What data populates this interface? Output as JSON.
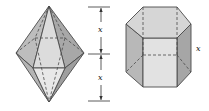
{
  "figure": {
    "left_shape": {
      "name": "hexagonal bipyramid",
      "upper_height_label": "x",
      "lower_height_label": "x"
    },
    "right_shape": {
      "name": "hexagonal prism",
      "height_label": "x"
    },
    "colors": {
      "outline": "#4a4a4a",
      "face_light": "#e6e6e6",
      "face_mid": "#c8c8c8",
      "face_dark": "#a9a9a9",
      "face_top": "#d9d9d9"
    }
  }
}
